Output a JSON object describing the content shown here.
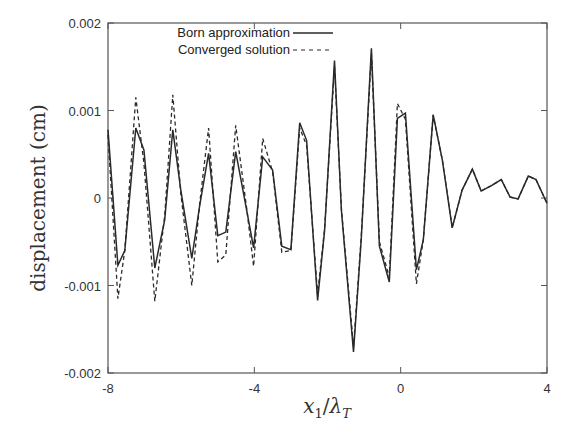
{
  "chart_data": {
    "type": "line",
    "title": "",
    "xlabel": "x_1/λ_T",
    "ylabel": "displacement (cm)",
    "xlim": [
      -8,
      4
    ],
    "ylim": [
      -0.002,
      0.002
    ],
    "x_ticks": [
      "-8",
      "-4",
      "0",
      "4"
    ],
    "y_ticks": [
      "0.002",
      "0.001",
      "0",
      "-0.001",
      "-0.002"
    ],
    "grid": false,
    "legend_position": "top-center",
    "series": [
      {
        "name": "Born approximation",
        "style": "solid",
        "x": [
          -8.0,
          -7.73,
          -7.54,
          -7.24,
          -7.02,
          -6.72,
          -6.45,
          -6.23,
          -6.01,
          -5.71,
          -5.49,
          -5.25,
          -5.0,
          -4.78,
          -4.51,
          -4.21,
          -4.02,
          -3.77,
          -3.5,
          -3.25,
          -3.0,
          -2.76,
          -2.57,
          -2.27,
          -2.08,
          -1.81,
          -1.62,
          -1.29,
          -1.08,
          -0.8,
          -0.58,
          -0.31,
          -0.09,
          0.13,
          0.43,
          0.62,
          0.89,
          1.14,
          1.41,
          1.68,
          1.96,
          2.2,
          2.47,
          2.75,
          2.99,
          3.21,
          3.49,
          3.7,
          4.0
        ],
        "y": [
          0.00078,
          -0.00077,
          -0.0006,
          0.0008,
          0.00055,
          -0.0008,
          -0.00025,
          0.00078,
          9e-05,
          -0.00069,
          -8e-05,
          0.00051,
          -0.00043,
          -0.00039,
          0.00053,
          -0.00014,
          -0.00057,
          0.00047,
          0.00032,
          -0.00055,
          -0.00059,
          0.00086,
          0.00066,
          -0.00117,
          -0.00037,
          0.00157,
          -0.00014,
          -0.00176,
          -0.00048,
          0.00171,
          -0.00055,
          -0.00096,
          0.00091,
          0.00097,
          -0.00082,
          -0.00048,
          0.00095,
          0.00043,
          -0.00034,
          9e-05,
          0.00033,
          8e-05,
          0.00014,
          0.00021,
          1e-05,
          -1e-05,
          0.00025,
          0.00021,
          -6e-05
        ]
      },
      {
        "name": "Converged solution",
        "style": "dashed",
        "x": [
          -8.0,
          -7.73,
          -7.54,
          -7.24,
          -7.02,
          -6.72,
          -6.45,
          -6.23,
          -6.01,
          -5.71,
          -5.49,
          -5.25,
          -5.0,
          -4.78,
          -4.51,
          -4.21,
          -4.02,
          -3.77,
          -3.5,
          -3.25,
          -3.0,
          -2.76,
          -2.57,
          -2.27,
          -2.08,
          -1.81,
          -1.62,
          -1.29,
          -1.08,
          -0.8,
          -0.58,
          -0.31,
          -0.09,
          0.13,
          0.43,
          0.62,
          0.89,
          1.14,
          1.41,
          1.68,
          1.96,
          2.2,
          2.47,
          2.75,
          2.99,
          3.21,
          3.49,
          3.7,
          4.0
        ],
        "y": [
          0.00072,
          -0.00115,
          -0.0006,
          0.00115,
          0.0004,
          -0.00118,
          -0.0002,
          0.00118,
          5e-05,
          -0.001,
          -5e-05,
          0.0008,
          -0.00073,
          -0.00065,
          0.00083,
          -0.00012,
          -0.00078,
          0.00068,
          0.0003,
          -0.00062,
          -0.0006,
          0.0008,
          0.0006,
          -0.0011,
          -0.00035,
          0.0015,
          -0.00012,
          -0.0017,
          -0.00045,
          0.00165,
          -0.0005,
          -0.0009,
          0.00108,
          0.0009,
          -0.00098,
          -0.00048,
          0.00095,
          0.00043,
          -0.00034,
          9e-05,
          0.00033,
          8e-05,
          0.00014,
          0.00021,
          1e-05,
          -1e-05,
          0.00025,
          0.00021,
          -6e-05
        ]
      }
    ]
  },
  "legend": {
    "items": [
      "Born approximation",
      "Converged solution"
    ]
  },
  "axes": {
    "ylabel": "displacement (cm)",
    "xlabel_main": "x",
    "xlabel_sub1": "1",
    "xlabel_slash": "/",
    "xlabel_lambda": "λ",
    "xlabel_sub2": "T"
  },
  "colors": {
    "line": "#2a2a2a",
    "frame": "#555555"
  }
}
